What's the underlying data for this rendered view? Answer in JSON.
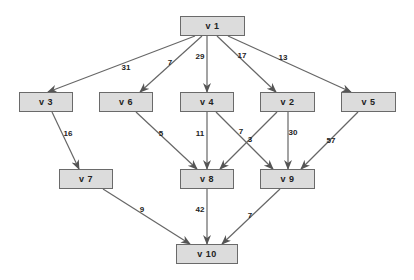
{
  "graph": {
    "edge_color": "#666666",
    "node_fill": "#dcdcdc",
    "node_border": "#6a6a6a",
    "nodes": [
      {
        "id": "v1",
        "label": "v 1",
        "x": 180,
        "y": 16,
        "w": 65,
        "h": 20
      },
      {
        "id": "v3",
        "label": "v 3",
        "x": 19,
        "y": 92,
        "w": 54,
        "h": 20
      },
      {
        "id": "v6",
        "label": "v 6",
        "x": 99,
        "y": 92,
        "w": 54,
        "h": 20
      },
      {
        "id": "v4",
        "label": "v 4",
        "x": 180,
        "y": 92,
        "w": 54,
        "h": 20
      },
      {
        "id": "v2",
        "label": "v 2",
        "x": 260,
        "y": 92,
        "w": 55,
        "h": 20
      },
      {
        "id": "v5",
        "label": "v 5",
        "x": 341,
        "y": 92,
        "w": 55,
        "h": 20
      },
      {
        "id": "v7",
        "label": "v 7",
        "x": 59,
        "y": 169,
        "w": 54,
        "h": 20
      },
      {
        "id": "v8",
        "label": "v 8",
        "x": 180,
        "y": 169,
        "w": 54,
        "h": 20
      },
      {
        "id": "v9",
        "label": "v 9",
        "x": 260,
        "y": 169,
        "w": 55,
        "h": 20
      },
      {
        "id": "v10",
        "label": "v 10",
        "x": 176,
        "y": 244,
        "w": 62,
        "h": 20
      }
    ],
    "edges": [
      {
        "from": "v1",
        "to": "v3",
        "weight": "31",
        "x1": 195,
        "y1": 36,
        "x2": 48,
        "y2": 92,
        "lx": 126,
        "ly": 67
      },
      {
        "from": "v1",
        "to": "v6",
        "weight": "7",
        "x1": 202,
        "y1": 36,
        "x2": 140,
        "y2": 92,
        "lx": 170,
        "ly": 62
      },
      {
        "from": "v1",
        "to": "v4",
        "weight": "29",
        "x1": 207,
        "y1": 36,
        "x2": 207,
        "y2": 92,
        "lx": 200,
        "ly": 56
      },
      {
        "from": "v1",
        "to": "v2",
        "weight": "17",
        "x1": 217,
        "y1": 36,
        "x2": 276,
        "y2": 92,
        "lx": 242,
        "ly": 55
      },
      {
        "from": "v1",
        "to": "v5",
        "weight": "13",
        "x1": 228,
        "y1": 36,
        "x2": 351,
        "y2": 92,
        "lx": 283,
        "ly": 57
      },
      {
        "from": "v3",
        "to": "v7",
        "weight": "16",
        "x1": 52,
        "y1": 112,
        "x2": 79,
        "y2": 169,
        "lx": 68,
        "ly": 133
      },
      {
        "from": "v6",
        "to": "v8",
        "weight": "5",
        "x1": 136,
        "y1": 112,
        "x2": 197,
        "y2": 169,
        "lx": 161,
        "ly": 133
      },
      {
        "from": "v4",
        "to": "v8",
        "weight": "11",
        "x1": 207,
        "y1": 112,
        "x2": 207,
        "y2": 169,
        "lx": 200,
        "ly": 133
      },
      {
        "from": "v4",
        "to": "v9",
        "weight": "7",
        "x1": 216,
        "y1": 112,
        "x2": 273,
        "y2": 169,
        "lx": 241,
        "ly": 131
      },
      {
        "from": "v2",
        "to": "v8",
        "weight": "3",
        "x1": 277,
        "y1": 112,
        "x2": 220,
        "y2": 169,
        "lx": 250,
        "ly": 139
      },
      {
        "from": "v2",
        "to": "v9",
        "weight": "30",
        "x1": 288,
        "y1": 112,
        "x2": 288,
        "y2": 169,
        "lx": 293,
        "ly": 132
      },
      {
        "from": "v5",
        "to": "v9",
        "weight": "57",
        "x1": 358,
        "y1": 112,
        "x2": 301,
        "y2": 169,
        "lx": 331,
        "ly": 140
      },
      {
        "from": "v7",
        "to": "v10",
        "weight": "9",
        "x1": 103,
        "y1": 189,
        "x2": 190,
        "y2": 244,
        "lx": 142,
        "ly": 209
      },
      {
        "from": "v8",
        "to": "v10",
        "weight": "42",
        "x1": 207,
        "y1": 189,
        "x2": 207,
        "y2": 244,
        "lx": 200,
        "ly": 209
      },
      {
        "from": "v9",
        "to": "v10",
        "weight": "7",
        "x1": 280,
        "y1": 189,
        "x2": 222,
        "y2": 244,
        "lx": 250,
        "ly": 215
      }
    ]
  }
}
